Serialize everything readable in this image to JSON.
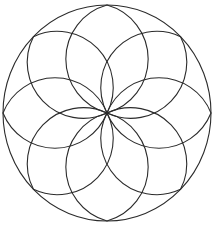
{
  "diagram": {
    "type": "rosette",
    "stroke_color": "#2b2b2b",
    "background": "#ffffff",
    "center": {
      "x": 107,
      "y": 113
    },
    "outer_circle": {
      "rx": 104,
      "ry": 108
    },
    "petals": {
      "count": 8,
      "length": 106,
      "arc_radius": 56,
      "angles_deg": [
        0,
        45,
        90,
        135,
        180,
        225,
        270,
        315
      ]
    }
  }
}
